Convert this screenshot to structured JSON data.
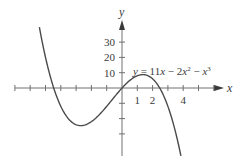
{
  "chart_data": {
    "type": "line",
    "title": "",
    "function_label": "y = 11x − 2x² − x³",
    "function_parts": {
      "y": "y",
      "eq": " = 11",
      "x1": "x",
      "minus1": " − 2",
      "x2": "x",
      "sup2": "2",
      "minus2": " − ",
      "x3": "x",
      "sup3": "3"
    },
    "xlabel": "x",
    "ylabel": "y",
    "x_tick_values": [
      -7,
      -6,
      -5,
      -4,
      -3,
      -2,
      -1,
      1,
      2,
      3,
      4,
      5,
      6
    ],
    "x_tick_labels": [
      {
        "value": 1,
        "label": "1"
      },
      {
        "value": 2,
        "label": "2"
      },
      {
        "value": 4,
        "label": "4"
      }
    ],
    "y_tick_values": [
      -30,
      -20,
      -10,
      10,
      20,
      30
    ],
    "y_tick_labels": [
      {
        "value": 10,
        "label": "10"
      },
      {
        "value": 20,
        "label": "20"
      },
      {
        "value": 30,
        "label": "30"
      }
    ],
    "xlim": [
      -7,
      6.6
    ],
    "ylim": [
      -44,
      44
    ],
    "grid": false,
    "legend": null,
    "series": [
      {
        "name": "y = 11x - 2x^2 - x^3",
        "coefficients": {
          "a3": -1,
          "a2": -2,
          "a1": 11,
          "a0": 0
        },
        "x_range": [
          -5.4,
          3.85
        ],
        "sample_points": [
          {
            "x": -5.4,
            "y": 40.7
          },
          {
            "x": -4.46,
            "y": 0
          },
          {
            "x": -4,
            "y": -12
          },
          {
            "x": -3,
            "y": -24
          },
          {
            "x": -2.69,
            "y": -24.6
          },
          {
            "x": -2,
            "y": -22
          },
          {
            "x": -1,
            "y": -12
          },
          {
            "x": 0,
            "y": 0
          },
          {
            "x": 1,
            "y": 8
          },
          {
            "x": 1.36,
            "y": 8.75
          },
          {
            "x": 2,
            "y": 6
          },
          {
            "x": 2.46,
            "y": 0
          },
          {
            "x": 3,
            "y": -12
          },
          {
            "x": 3.85,
            "y": -44.4
          }
        ]
      }
    ],
    "colors": {
      "axis": "#707070",
      "curve": "#4a4a4a",
      "text": "#3a3a3a"
    }
  }
}
